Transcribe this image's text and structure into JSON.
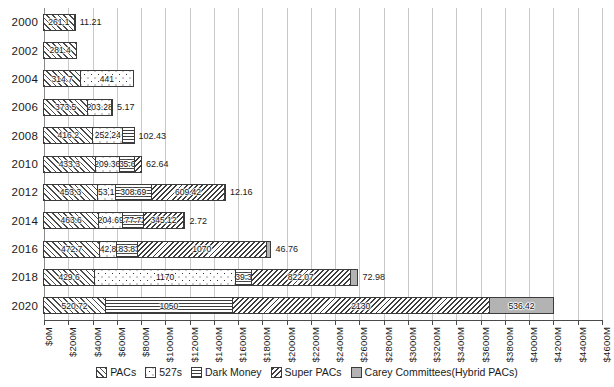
{
  "chart_data": {
    "type": "bar",
    "orientation": "horizontal",
    "stacked": true,
    "title": "",
    "xlabel": "",
    "ylabel": "",
    "xlim": [
      0,
      4600
    ],
    "xtick_step": 200,
    "grid": true,
    "legend_position": "bottom",
    "categories": [
      "2000",
      "2002",
      "2004",
      "2006",
      "2008",
      "2010",
      "2012",
      "2014",
      "2016",
      "2018",
      "2020"
    ],
    "xticks": [
      "$0M",
      "$200M",
      "$400M",
      "$600M",
      "$800M",
      "$1000M",
      "$1200M",
      "$1400M",
      "$1600M",
      "$1800M",
      "$2000M",
      "$2200M",
      "$2400M",
      "$2600M",
      "$2800M",
      "$3000M",
      "$3200M",
      "$3400M",
      "$3600M",
      "$3800M",
      "$4000M",
      "$4200M",
      "$4400M",
      "$4600M"
    ],
    "series": [
      {
        "name": "PACs",
        "pattern": "diagonal-hatch",
        "values": [
          261.1,
          281.4,
          314.7,
          373.5,
          416.2,
          433.3,
          453.3,
          463.6,
          472.7,
          429.6,
          520.72
        ]
      },
      {
        "name": "527s",
        "pattern": "dots",
        "values": [
          0,
          0,
          441,
          203.28,
          252.24,
          209.36,
          153.13,
          204.69,
          142.82,
          1170,
          0
        ]
      },
      {
        "name": "Dark Money",
        "pattern": "horizontal-lines",
        "values": [
          11.21,
          0,
          0,
          5.17,
          102.43,
          135.61,
          308.69,
          177.72,
          183.83,
          139.31,
          1050
        ]
      },
      {
        "name": "Super PACs",
        "pattern": "reverse-diagonal-hatch",
        "values": [
          0,
          0,
          0,
          0,
          0,
          62.64,
          609.42,
          345.12,
          1070,
          822.07,
          2130
        ]
      },
      {
        "name": "Carey Committees(Hybrid PACs)",
        "pattern": "solid-grey",
        "values": [
          0,
          0,
          0,
          0,
          0,
          0,
          12.16,
          2.72,
          46.76,
          72.98,
          536.42
        ]
      }
    ],
    "bars": [
      {
        "year": "2000",
        "segments": [
          {
            "series": "PACs",
            "value": 261.1,
            "label": "261.1",
            "label_inside": true
          },
          {
            "series": "Dark Money",
            "value": 11.21,
            "label": "11.21",
            "label_inside": false
          }
        ]
      },
      {
        "year": "2002",
        "segments": [
          {
            "series": "PACs",
            "value": 281.4,
            "label": "281.4",
            "label_inside": true
          }
        ]
      },
      {
        "year": "2004",
        "segments": [
          {
            "series": "PACs",
            "value": 314.7,
            "label": "314.7",
            "label_inside": true
          },
          {
            "series": "527s",
            "value": 441,
            "label": "441",
            "label_inside": true
          }
        ]
      },
      {
        "year": "2006",
        "segments": [
          {
            "series": "PACs",
            "value": 373.5,
            "label": "373.5",
            "label_inside": true
          },
          {
            "series": "527s",
            "value": 203.28,
            "label": "203.28",
            "label_inside": true
          },
          {
            "series": "Dark Money",
            "value": 5.17,
            "label": "5.17",
            "label_inside": false
          }
        ]
      },
      {
        "year": "2008",
        "segments": [
          {
            "series": "PACs",
            "value": 416.2,
            "label": "416.2",
            "label_inside": true
          },
          {
            "series": "527s",
            "value": 252.24,
            "label": "252.24",
            "label_inside": true
          },
          {
            "series": "Dark Money",
            "value": 102.43,
            "label": "102.43",
            "label_inside": false
          }
        ]
      },
      {
        "year": "2010",
        "segments": [
          {
            "series": "PACs",
            "value": 433.3,
            "label": "433.3",
            "label_inside": true
          },
          {
            "series": "527s",
            "value": 209.36,
            "label": "209.36",
            "label_inside": true
          },
          {
            "series": "Dark Money",
            "value": 135.61,
            "label": "135.61",
            "label_inside": true
          },
          {
            "series": "Super PACs",
            "value": 62.64,
            "label": "62.64",
            "label_inside": false
          }
        ]
      },
      {
        "year": "2012",
        "segments": [
          {
            "series": "PACs",
            "value": 453.3,
            "label": "453.3",
            "label_inside": true
          },
          {
            "series": "527s",
            "value": 153.13,
            "label": "153.13",
            "label_inside": true
          },
          {
            "series": "Dark Money",
            "value": 308.69,
            "label": "308.69",
            "label_inside": true
          },
          {
            "series": "Super PACs",
            "value": 609.42,
            "label": "609.42",
            "label_inside": true
          },
          {
            "series": "Carey Committees(Hybrid PACs)",
            "value": 12.16,
            "label": "12.16",
            "label_inside": false
          }
        ]
      },
      {
        "year": "2014",
        "segments": [
          {
            "series": "PACs",
            "value": 463.6,
            "label": "463.6",
            "label_inside": true
          },
          {
            "series": "527s",
            "value": 204.69,
            "label": "204.69",
            "label_inside": true
          },
          {
            "series": "Dark Money",
            "value": 177.72,
            "label": "177.72",
            "label_inside": true
          },
          {
            "series": "Super PACs",
            "value": 345.12,
            "label": "345.12",
            "label_inside": true
          },
          {
            "series": "Carey Committees(Hybrid PACs)",
            "value": 2.72,
            "label": "2.72",
            "label_inside": false
          }
        ]
      },
      {
        "year": "2016",
        "segments": [
          {
            "series": "PACs",
            "value": 472.7,
            "label": "472.7",
            "label_inside": true
          },
          {
            "series": "527s",
            "value": 142.82,
            "label": "142.82",
            "label_inside": true
          },
          {
            "series": "Dark Money",
            "value": 183.83,
            "label": "183.83",
            "label_inside": true
          },
          {
            "series": "Super PACs",
            "value": 1070,
            "label": "1070",
            "label_inside": true
          },
          {
            "series": "Carey Committees(Hybrid PACs)",
            "value": 46.76,
            "label": "46.76",
            "label_inside": false
          }
        ]
      },
      {
        "year": "2018",
        "segments": [
          {
            "series": "PACs",
            "value": 429.6,
            "label": "429.6",
            "label_inside": true
          },
          {
            "series": "527s",
            "value": 1170,
            "label": "1170",
            "label_inside": true
          },
          {
            "series": "Dark Money",
            "value": 139.31,
            "label": "139.31",
            "label_inside": true
          },
          {
            "series": "Super PACs",
            "value": 822.07,
            "label": "822.07",
            "label_inside": true
          },
          {
            "series": "Carey Committees(Hybrid PACs)",
            "value": 72.98,
            "label": "72.98",
            "label_inside": false
          }
        ]
      },
      {
        "year": "2020",
        "segments": [
          {
            "series": "PACs",
            "value": 520.72,
            "label": "520.72",
            "label_inside": true
          },
          {
            "series": "Dark Money",
            "value": 1050,
            "label": "1050",
            "label_inside": true
          },
          {
            "series": "Super PACs",
            "value": 2130,
            "label": "2130",
            "label_inside": true
          },
          {
            "series": "Carey Committees(Hybrid PACs)",
            "value": 536.42,
            "label": "536.42",
            "label_inside": true
          }
        ]
      }
    ],
    "legend": [
      {
        "label": "PACs",
        "pattern": "diagonal-hatch"
      },
      {
        "label": "527s",
        "pattern": "dots"
      },
      {
        "label": "Dark Money",
        "pattern": "horizontal-lines"
      },
      {
        "label": "Super PACs",
        "pattern": "reverse-diagonal-hatch"
      },
      {
        "label": "Carey Committees(Hybrid PACs)",
        "pattern": "solid-grey"
      }
    ],
    "colors": {
      "grid": "#c9c9c9",
      "axis": "#4a4a4a",
      "outline": "#3b3b3b",
      "carey_fill": "#b3b3b3",
      "background": "#ffffff",
      "text": "#1a1a1a"
    }
  }
}
